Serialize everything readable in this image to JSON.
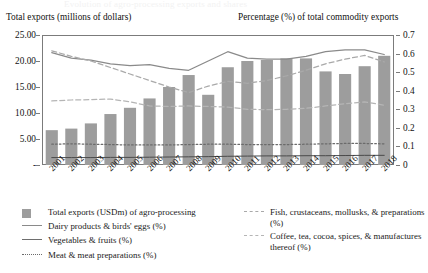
{
  "ghost_title": "Evolution of agro-processing exports and shares",
  "axis_captions": {
    "left": "Total exports (millions of dollars)",
    "right": "Percentage (%) of total commodity exports"
  },
  "legend": {
    "column_a": [
      {
        "label": "Total exports (USDm) of agro-processing",
        "marker": "swatch",
        "color": "#9d9d9d"
      },
      {
        "label": "Dairy products & birds' eggs (%)",
        "marker": "solid",
        "color": "#8a8a8a"
      },
      {
        "label": "Vegetables & fruits (%)",
        "marker": "solid-dark",
        "color": "#6e6e6e"
      },
      {
        "label": "Meat & meat preparations (%)",
        "marker": "dotted",
        "color": "#6b6b6b"
      }
    ],
    "column_b": [
      {
        "label": "Fish, crustaceans, mollusks, & preparations (%)",
        "marker": "dashed",
        "color": "#a9a9a9"
      },
      {
        "label": "Coffee, tea, cocoa, spices, & manufactures thereof (%)",
        "marker": "dashed",
        "color": "#b5b5b5"
      }
    ]
  },
  "chart_data": {
    "type": "bar",
    "title": "",
    "xlabel": "",
    "ylabel": "Total exports (millions of dollars)",
    "y2label": "Percentage (%) of total commodity exports",
    "grid": false,
    "legend_position": "bottom",
    "categories": [
      "2001",
      "2002",
      "2003",
      "2004",
      "2005",
      "2006",
      "2007",
      "2008",
      "2009",
      "2010",
      "2011",
      "2012",
      "2013",
      "2014",
      "2015",
      "2016",
      "2017",
      "2018"
    ],
    "ylim": [
      0,
      25
    ],
    "yticks": [
      "-",
      "5.00",
      "10.00",
      "15.00",
      "20.00",
      "25.00"
    ],
    "ytick_values": [
      0,
      5,
      10,
      15,
      20,
      25
    ],
    "y2lim": [
      0,
      0.7
    ],
    "y2ticks": [
      "0",
      "0.1",
      "0.2",
      "0.3",
      "0.4",
      "0.5",
      "0.6",
      "0.7"
    ],
    "y2tick_values": [
      0,
      0.1,
      0.2,
      0.3,
      0.4,
      0.5,
      0.6,
      0.7
    ],
    "bar_series": {
      "name": "Total exports (USDm) of agro-processing",
      "axis": "left",
      "color": "#9d9d9d",
      "values": [
        6.7,
        7.0,
        8.0,
        9.8,
        11.0,
        12.8,
        15.0,
        17.3,
        13.5,
        18.8,
        20.0,
        20.2,
        20.5,
        20.5,
        18.0,
        17.5,
        19.0,
        21.0
      ]
    },
    "series": [
      {
        "name": "Dairy products & birds' eggs (%)",
        "axis": "right",
        "style": "solid",
        "color": "#8a8a8a",
        "values": [
          0.605,
          0.575,
          0.565,
          0.545,
          0.535,
          0.54,
          0.52,
          0.51,
          0.56,
          0.61,
          0.575,
          0.57,
          0.57,
          0.585,
          0.61,
          0.62,
          0.62,
          0.595
        ]
      },
      {
        "name": "Fish, crustaceans, mollusks, & preparations (%)",
        "axis": "right",
        "style": "dashed",
        "color": "#a9a9a9",
        "values": [
          0.615,
          0.585,
          0.56,
          0.525,
          0.49,
          0.455,
          0.42,
          0.39,
          0.425,
          0.45,
          0.44,
          0.455,
          0.48,
          0.51,
          0.545,
          0.57,
          0.59,
          0.555
        ]
      },
      {
        "name": "Coffee, tea, cocoa, spices, & manufactures thereof (%)",
        "axis": "right",
        "style": "dashed",
        "color": "#b5b5b5",
        "values": [
          0.345,
          0.35,
          0.352,
          0.355,
          0.34,
          0.318,
          0.315,
          0.318,
          0.315,
          0.312,
          0.3,
          0.298,
          0.3,
          0.305,
          0.318,
          0.33,
          0.34,
          0.322
        ]
      },
      {
        "name": "Vegetables & fruits (%)",
        "axis": "right",
        "style": "solid-dark",
        "color": "#4a4a4a",
        "values": [
          0.04,
          0.04,
          0.04,
          0.041,
          0.041,
          0.042,
          0.043,
          0.044,
          0.045,
          0.047,
          0.048,
          0.049,
          0.049,
          0.05,
          0.05,
          0.051,
          0.052,
          0.052
        ]
      },
      {
        "name": "Meat & meat preparations (%)",
        "axis": "right",
        "style": "dotted",
        "color": "#6b6b6b",
        "values": [
          0.112,
          0.114,
          0.112,
          0.11,
          0.108,
          0.108,
          0.108,
          0.11,
          0.112,
          0.112,
          0.11,
          0.11,
          0.11,
          0.112,
          0.114,
          0.116,
          0.116,
          0.114
        ]
      }
    ]
  }
}
